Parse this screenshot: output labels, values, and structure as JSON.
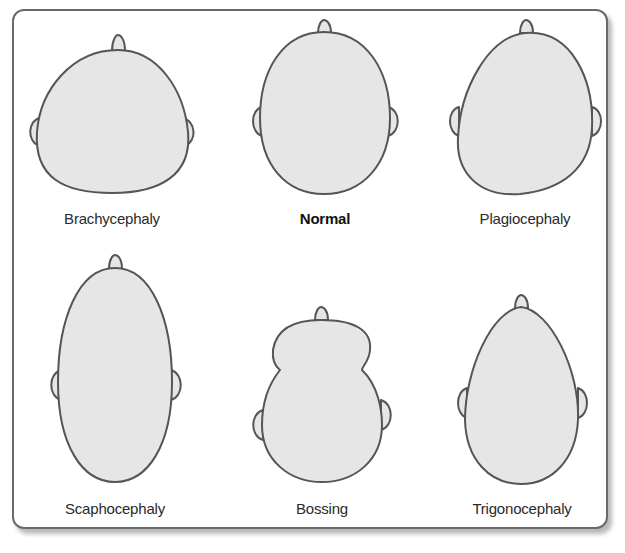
{
  "figure": {
    "colors": {
      "frame_border": "#6a6a6a",
      "head_fill": "#e6e6e6",
      "head_stroke": "#555555",
      "label_text": "#2a2a2a"
    },
    "shapes": [
      {
        "id": "brachycephaly",
        "label": "Brachycephaly",
        "emphasis": false,
        "row": 1,
        "col": 1
      },
      {
        "id": "normal",
        "label": "Normal",
        "emphasis": true,
        "row": 1,
        "col": 2
      },
      {
        "id": "plagiocephaly",
        "label": "Plagiocephaly",
        "emphasis": false,
        "row": 1,
        "col": 3
      },
      {
        "id": "scaphocephaly",
        "label": "Scaphocephaly",
        "emphasis": false,
        "row": 2,
        "col": 1
      },
      {
        "id": "bossing",
        "label": "Bossing",
        "emphasis": false,
        "row": 2,
        "col": 2
      },
      {
        "id": "trigonocephaly",
        "label": "Trigonocephaly",
        "emphasis": false,
        "row": 2,
        "col": 3
      }
    ]
  }
}
